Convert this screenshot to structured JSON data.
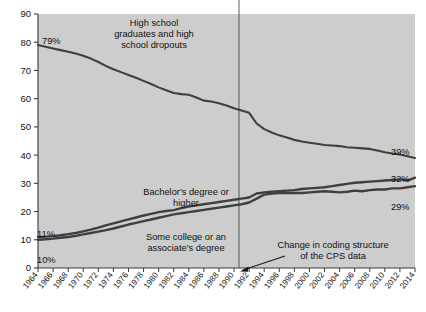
{
  "chart_data": {
    "type": "line",
    "title": "",
    "subtitle": "",
    "xlabel": "",
    "ylabel": "",
    "xlim": [
      1964,
      2014
    ],
    "ylim": [
      0,
      90
    ],
    "grid": false,
    "legend_position": "inline-annotations",
    "background_color": "#cdcdcd",
    "line_color": "#3f3f3f",
    "axis_color": "#3a3a3a",
    "x": [
      1964,
      1965,
      1966,
      1967,
      1968,
      1969,
      1970,
      1971,
      1972,
      1973,
      1974,
      1975,
      1976,
      1977,
      1978,
      1979,
      1980,
      1981,
      1982,
      1983,
      1984,
      1985,
      1986,
      1987,
      1988,
      1989,
      1990,
      1991,
      1992,
      1993,
      1994,
      1995,
      1996,
      1997,
      1998,
      1999,
      2000,
      2001,
      2002,
      2003,
      2004,
      2005,
      2006,
      2007,
      2008,
      2009,
      2010,
      2011,
      2012,
      2013,
      2014
    ],
    "xtick_labels": [
      "1964",
      "1966",
      "1968",
      "1970",
      "1972",
      "1974",
      "1976",
      "1978",
      "1980",
      "1982",
      "1984",
      "1986",
      "1988",
      "1990",
      "1992",
      "1994",
      "1996",
      "1998",
      "2000",
      "2002",
      "2004",
      "2006",
      "2008",
      "2010",
      "2012",
      "2014"
    ],
    "ytick_labels": [
      "0",
      "10",
      "20",
      "30",
      "40",
      "50",
      "60",
      "70",
      "80",
      "90"
    ],
    "series": [
      {
        "name": "High school graduates and high school dropouts",
        "label_text": "High school\ngraduates and high\nschool dropouts",
        "start_value_label": "79%",
        "end_value_label": "39%",
        "values": [
          79.0,
          78.4,
          77.8,
          77.2,
          76.6,
          76.0,
          75.2,
          74.2,
          73.0,
          71.6,
          70.4,
          69.4,
          68.4,
          67.4,
          66.3,
          65.2,
          64.0,
          63.0,
          62.0,
          61.6,
          61.4,
          60.4,
          59.3,
          59.0,
          58.4,
          57.6,
          56.6,
          55.8,
          55.0,
          51.2,
          49.2,
          48.0,
          47.0,
          46.2,
          45.4,
          44.8,
          44.4,
          44.0,
          43.6,
          43.4,
          43.2,
          42.8,
          42.6,
          42.4,
          42.2,
          41.6,
          41.0,
          40.6,
          40.2,
          39.6,
          39.0
        ]
      },
      {
        "name": "Bachelor's degree or higher",
        "label_text": "Bachelor's degree or\nhigher",
        "start_value_label": "11%",
        "end_value_label": "32%",
        "values": [
          11.0,
          11.1,
          11.3,
          11.6,
          12.0,
          12.4,
          13.0,
          13.6,
          14.3,
          15.1,
          15.8,
          16.5,
          17.2,
          17.9,
          18.6,
          19.2,
          19.8,
          20.2,
          20.5,
          21.2,
          21.8,
          22.2,
          22.6,
          23.0,
          23.4,
          23.8,
          24.2,
          24.6,
          25.0,
          26.4,
          26.8,
          27.0,
          27.2,
          27.4,
          27.6,
          28.0,
          28.2,
          28.4,
          28.6,
          29.0,
          29.4,
          29.8,
          30.2,
          30.4,
          30.6,
          30.8,
          31.0,
          31.2,
          31.4,
          31.0,
          32.0
        ]
      },
      {
        "name": "Some college or an associate's degree",
        "label_text": "Some college or an\nassociate's degree",
        "start_value_label": "10%",
        "end_value_label": "29%",
        "values": [
          10.0,
          10.2,
          10.4,
          10.7,
          11.0,
          11.4,
          11.9,
          12.4,
          12.9,
          13.4,
          14.0,
          14.7,
          15.4,
          16.0,
          16.6,
          17.2,
          17.8,
          18.4,
          19.0,
          19.4,
          19.8,
          20.2,
          20.6,
          21.0,
          21.4,
          21.8,
          22.2,
          22.6,
          23.2,
          24.6,
          26.0,
          26.4,
          26.6,
          26.6,
          26.6,
          26.6,
          26.8,
          27.0,
          27.2,
          27.0,
          26.8,
          27.0,
          27.4,
          27.2,
          27.6,
          27.8,
          27.8,
          28.2,
          28.2,
          28.6,
          29.0
        ]
      }
    ],
    "annotations": [
      {
        "id": "coding-change",
        "text_line1": "Change in coding structure",
        "text_line2": "of the CPS data",
        "marker_year": 1992,
        "marker_type": "vertical-line-with-arrow"
      }
    ]
  }
}
